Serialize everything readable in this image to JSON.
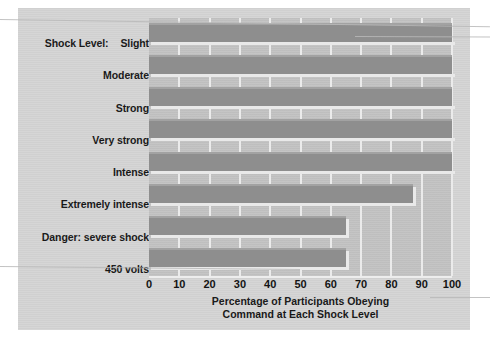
{
  "chart_data": {
    "type": "bar",
    "orientation": "horizontal",
    "title": "",
    "subtitle": "",
    "xlabel_line1": "Percentage of Participants Obeying",
    "xlabel_line2": "Command at Each Shock Level",
    "ylabel": "Shock Level:",
    "categories": [
      "Slight",
      "Moderate",
      "Strong",
      "Very strong",
      "Intense",
      "Extremely intense",
      "Danger: severe shock",
      "450 volts"
    ],
    "values": [
      100,
      100,
      100,
      100,
      100,
      87,
      65,
      65
    ],
    "xlim": [
      0,
      100
    ],
    "xticks": [
      0,
      10,
      20,
      30,
      40,
      50,
      60,
      70,
      80,
      90,
      100
    ],
    "xtick_labels": [
      "0",
      "10",
      "20",
      "30",
      "40",
      "50",
      "60",
      "70",
      "80",
      "90",
      "100"
    ],
    "grid": "vertical",
    "legend": "none",
    "bar_color": "#8e8e8e",
    "plot_bg_color": "#c2c2c2",
    "gridline_color": "#ebebeb",
    "panel_bg_color": "#d4d4d4",
    "page_bg_color": "#ffffff"
  },
  "labels": {
    "axis_prefix": "Shock Level:",
    "rows": [
      {
        "prefix": "Shock Level:",
        "text": "Slight"
      },
      {
        "prefix": "",
        "text": "Moderate"
      },
      {
        "prefix": "",
        "text": "Strong"
      },
      {
        "prefix": "",
        "text": "Very strong"
      },
      {
        "prefix": "",
        "text": "Intense"
      },
      {
        "prefix": "",
        "text": "Extremely intense"
      },
      {
        "prefix": "",
        "text": "Danger: severe shock"
      },
      {
        "prefix": "",
        "text": "450 volts"
      }
    ]
  }
}
